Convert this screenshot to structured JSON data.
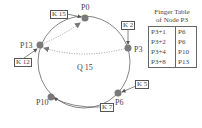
{
  "diagram": {
    "type": "chord-ring",
    "nodes": [
      {
        "id": "P0",
        "label": "P0"
      },
      {
        "id": "P3",
        "label": "P3"
      },
      {
        "id": "P6",
        "label": "P6"
      },
      {
        "id": "P10",
        "label": "P10"
      },
      {
        "id": "P13",
        "label": "P13"
      }
    ],
    "keys": [
      {
        "label": "K 15",
        "stored_at": "P0"
      },
      {
        "label": "K 2",
        "stored_at": "P3"
      },
      {
        "label": "K 5",
        "stored_at": "P6"
      },
      {
        "label": "K 7",
        "stored_at": "P10"
      },
      {
        "label": "K 12",
        "stored_at": "P13"
      }
    ],
    "query": {
      "label": "Q 15",
      "path": [
        "P3",
        "P13",
        "P0"
      ]
    },
    "finger_table": {
      "title_line1": "Finger Table",
      "title_line2": "of Node P3",
      "rows": [
        {
          "start": "P3+1",
          "succ": "P6"
        },
        {
          "start": "P3+2",
          "succ": "P6"
        },
        {
          "start": "P3+4",
          "succ": "P10"
        },
        {
          "start": "P3+8",
          "succ": "P13"
        }
      ]
    },
    "colors": {
      "node": "#7a7a7a",
      "ring": "#555555",
      "query": "#999999"
    }
  }
}
